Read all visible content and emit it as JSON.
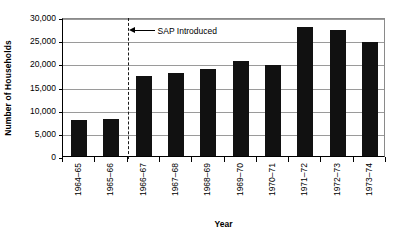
{
  "chart_data": {
    "type": "bar",
    "title": "",
    "xlabel": "Year",
    "ylabel": "Number of Households",
    "categories": [
      "1964–65",
      "1965–66",
      "1966–67",
      "1967–68",
      "1968–69",
      "1969–70",
      "1970–71",
      "1971–72",
      "1972–73",
      "1973–74"
    ],
    "values": [
      7800,
      7900,
      17200,
      17900,
      18700,
      20400,
      19600,
      27900,
      27300,
      24500
    ],
    "ylim": [
      0,
      30000
    ],
    "ytick_values": [
      0,
      5000,
      10000,
      15000,
      20000,
      25000,
      30000
    ],
    "ytick_labels": [
      "0",
      "5,000",
      "10,000",
      "15,000",
      "20,000",
      "25,000",
      "30,000"
    ],
    "grid": true,
    "legend": "none",
    "bar_color": "#111111",
    "annotations": [
      {
        "text": "SAP Introduced",
        "marker": "vertical-dashed-line",
        "marker_position_between": [
          "1965–66",
          "1966–67"
        ],
        "arrow": "left-arrow",
        "y_value": 27500
      }
    ]
  }
}
